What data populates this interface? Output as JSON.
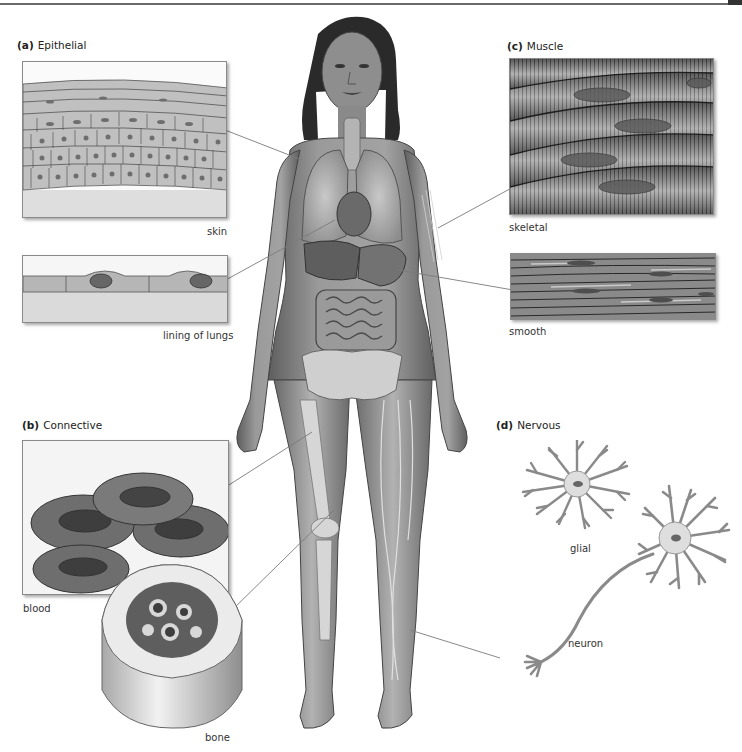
{
  "figure": {
    "type": "anatomical-diagram",
    "colors": {
      "leader_line": "#7a7a7a",
      "panel_border": "#8a8a8a",
      "skin_tone": "#8c8c8c",
      "cell_fill": "#b8b8b8",
      "nucleus": "#6e6e6e",
      "muscle_dark": "#5a5a5a",
      "muscle_light": "#a5a5a5"
    }
  },
  "sections": {
    "epithelial": {
      "letter": "(a)",
      "title": "Epithelial",
      "panels": [
        {
          "id": "skin",
          "caption": "skin"
        },
        {
          "id": "lining",
          "caption": "lining of lungs"
        }
      ]
    },
    "connective": {
      "letter": "(b)",
      "title": "Connective",
      "panels": [
        {
          "id": "blood",
          "caption": "blood"
        },
        {
          "id": "bone",
          "caption": "bone"
        }
      ]
    },
    "muscle": {
      "letter": "(c)",
      "title": "Muscle",
      "panels": [
        {
          "id": "skeletal",
          "caption": "skeletal"
        },
        {
          "id": "smooth",
          "caption": "smooth"
        }
      ]
    },
    "nervous": {
      "letter": "(d)",
      "title": "Nervous",
      "panels": [
        {
          "id": "glial",
          "caption": "glial"
        },
        {
          "id": "neuron",
          "caption": "neuron"
        }
      ]
    }
  }
}
